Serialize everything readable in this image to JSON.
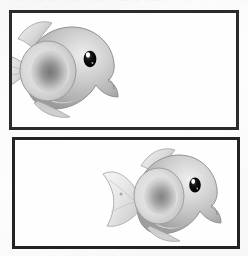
{
  "document": {
    "type": "scanned-page",
    "page_background": "#fdfdfd",
    "orientation": "portrait",
    "width_px": 248,
    "height_px": 256
  },
  "header": {
    "clipped_text_left": "▬▬ ▬▬▬ ▬▬ ▬▬▬ ▬▬ ▬▬",
    "clipped_text_right": "▬▬  ▬▬  ▬  ▬  ▬  ▬",
    "note": "text cut off at top edge of scan, illegible"
  },
  "figures": [
    {
      "id": "figure-1",
      "frame_border_color": "#2b2b2b",
      "frame_border_width_px": 3,
      "subject": "cartoon fish",
      "subject_alignment": "left",
      "subject_cropped": "tail clipped by left frame edge",
      "caption": ""
    },
    {
      "id": "figure-2",
      "frame_border_color": "#232323",
      "frame_border_width_px": 3,
      "subject": "cartoon fish",
      "subject_alignment": "center-right",
      "subject_cropped": "none, full body with tail fin visible",
      "caption": ""
    }
  ],
  "artwork": {
    "style": "grayscale airbrush illustration",
    "body_color": "#b9b9b9",
    "body_highlight_color": "#e8e8e8",
    "body_shadow_color": "#8f8f8f",
    "fin_color": "#dcdcdc",
    "fin_shadow_color": "#9a9a9a",
    "pectoral_fin_core_color": "#6e6e6e",
    "eye_color": "#141414",
    "eye_highlight_color": "#ffffff",
    "outline_color": "#7a7a7a"
  }
}
